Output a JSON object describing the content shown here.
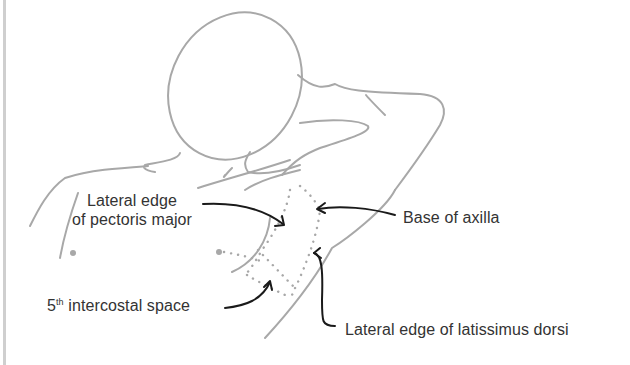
{
  "diagram": {
    "colors": {
      "outline": "#a8a8a8",
      "dotted_region": "#a8a8a8",
      "arrow": "#1a1a1a",
      "text": "#333333",
      "border": "#cfcfcf",
      "background": "#ffffff"
    },
    "labels": {
      "pectoralis": {
        "line1": "Lateral edge",
        "line2": "of pectoris major"
      },
      "axilla": "Base of axilla",
      "intercostal": {
        "ordinal": "5",
        "suffix": "th",
        "text": " intercostal space"
      },
      "latissimus": "Lateral edge of latissimus dorsi"
    }
  }
}
